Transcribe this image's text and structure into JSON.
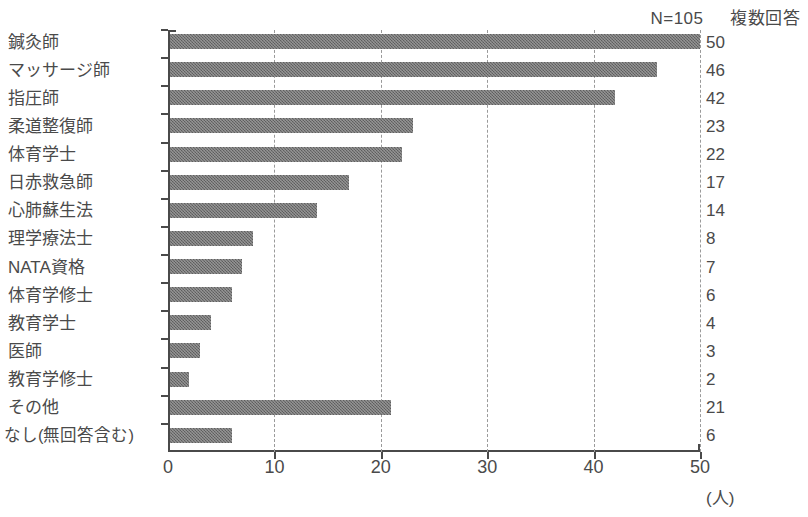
{
  "header": {
    "sample_size": "N=105",
    "note": "複数回答"
  },
  "axis": {
    "unit_label": "(人)",
    "x_ticks": [
      "0",
      "10",
      "20",
      "30",
      "40",
      "50"
    ]
  },
  "chart_data": {
    "type": "bar",
    "orientation": "horizontal",
    "title": "",
    "subtitle": "",
    "xlabel": "(人)",
    "ylabel": "",
    "xlim": [
      0,
      50
    ],
    "x_ticks": [
      0,
      10,
      20,
      30,
      40,
      50
    ],
    "grid": "vertical-dashed",
    "legend": "none",
    "annotations": [
      "N=105",
      "複数回答"
    ],
    "categories": [
      "鍼灸師",
      "マッサージ師",
      "指圧師",
      "柔道整復師",
      "体育学士",
      "日赤救急師",
      "心肺蘇生法",
      "理学療法士",
      "NATA資格",
      "体育学修士",
      "教育学士",
      "医師",
      "教育学修士",
      "その他",
      "なし(無回答含む)"
    ],
    "values": [
      50,
      46,
      42,
      23,
      22,
      17,
      14,
      8,
      7,
      6,
      4,
      3,
      2,
      21,
      6
    ],
    "value_labels": [
      "50",
      "46",
      "42",
      "23",
      "22",
      "17",
      "14",
      "8",
      "7",
      "6",
      "4",
      "3",
      "2",
      "21",
      "6"
    ],
    "bar_color": "#6e6e6e"
  }
}
